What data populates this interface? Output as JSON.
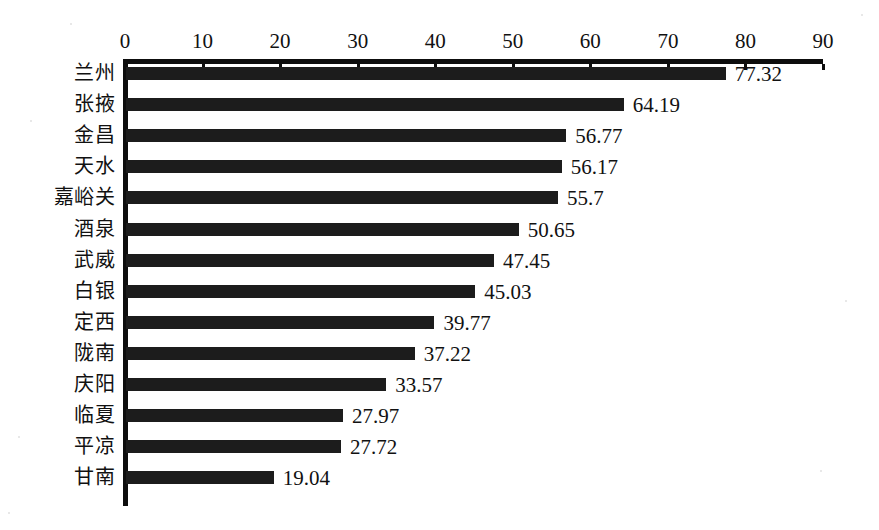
{
  "chart_data": {
    "type": "bar",
    "orientation": "horizontal",
    "title": "",
    "subtitle": "",
    "xlabel": "",
    "ylabel": "",
    "xlim": [
      0,
      90
    ],
    "xticks": [
      0,
      10,
      20,
      30,
      40,
      50,
      60,
      70,
      80,
      90
    ],
    "xtick_labels": [
      "0",
      "10",
      "20",
      "30",
      "40",
      "50",
      "60",
      "70",
      "80",
      "90"
    ],
    "grid": false,
    "legend": null,
    "bar_color": "#1c1c1c",
    "axis_color": "#0d0d0d",
    "background_color": "#ffffff",
    "show_value_labels": true,
    "categories": [
      "兰州",
      "张掖",
      "金昌",
      "天水",
      "嘉峪关",
      "酒泉",
      "武威",
      "白银",
      "定西",
      "陇南",
      "庆阳",
      "临夏",
      "平凉",
      "甘南"
    ],
    "values": [
      77.32,
      64.19,
      56.77,
      56.17,
      55.7,
      50.65,
      47.45,
      45.03,
      39.77,
      37.22,
      33.57,
      27.97,
      27.72,
      19.04
    ],
    "value_labels": [
      "77.32",
      "64.19",
      "56.77",
      "56.17",
      "55.7",
      "50.65",
      "47.45",
      "45.03",
      "39.77",
      "37.22",
      "33.57",
      "27.97",
      "27.72",
      "19.04"
    ],
    "series": [
      {
        "name": "",
        "values": [
          77.32,
          64.19,
          56.77,
          56.17,
          55.7,
          50.65,
          47.45,
          45.03,
          39.77,
          37.22,
          33.57,
          27.97,
          27.72,
          19.04
        ]
      }
    ]
  }
}
